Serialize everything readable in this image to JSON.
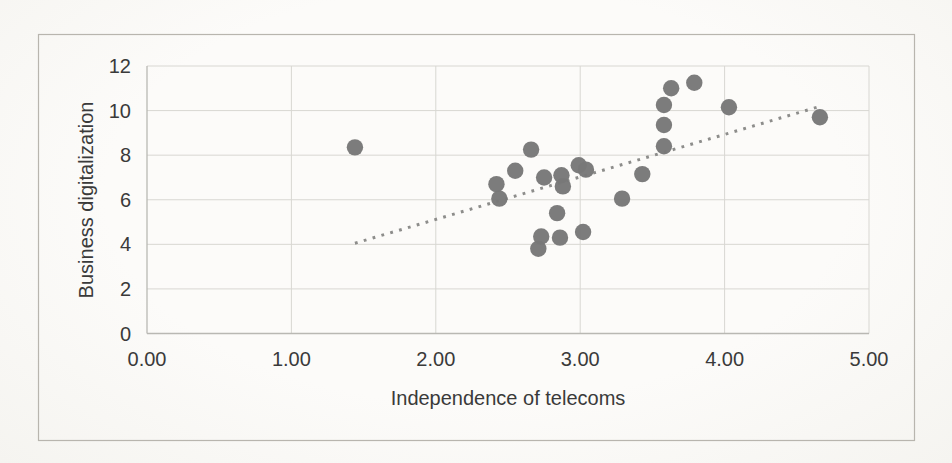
{
  "chart_data": {
    "type": "scatter",
    "title": "",
    "xlabel": "Independence of telecoms",
    "ylabel": "Business digitalization",
    "xlim": [
      0,
      5
    ],
    "ylim": [
      0,
      12
    ],
    "grid": true,
    "legend": false,
    "xticks": {
      "values": [
        0,
        1,
        2,
        3,
        4,
        5
      ],
      "labels": [
        "0.00",
        "1.00",
        "2.00",
        "3.00",
        "4.00",
        "5.00"
      ]
    },
    "yticks": {
      "values": [
        0,
        2,
        4,
        6,
        8,
        10,
        12
      ],
      "labels": [
        "0",
        "2",
        "4",
        "6",
        "8",
        "10",
        "12"
      ]
    },
    "points": [
      [
        1.44,
        8.35
      ],
      [
        2.42,
        6.7
      ],
      [
        2.44,
        6.05
      ],
      [
        2.55,
        7.3
      ],
      [
        2.66,
        8.25
      ],
      [
        2.71,
        3.8
      ],
      [
        2.73,
        4.35
      ],
      [
        2.75,
        7.0
      ],
      [
        2.84,
        5.4
      ],
      [
        2.86,
        4.3
      ],
      [
        2.87,
        7.1
      ],
      [
        2.88,
        6.6
      ],
      [
        2.99,
        7.55
      ],
      [
        3.04,
        7.35
      ],
      [
        3.02,
        4.55
      ],
      [
        3.29,
        6.05
      ],
      [
        3.43,
        7.15
      ],
      [
        3.58,
        8.4
      ],
      [
        3.58,
        9.35
      ],
      [
        3.58,
        10.25
      ],
      [
        3.63,
        11.0
      ],
      [
        3.79,
        11.25
      ],
      [
        4.03,
        10.15
      ],
      [
        4.66,
        9.7
      ]
    ],
    "trendline": {
      "type": "linear",
      "style": "dotted",
      "x1": 1.44,
      "y1": 4.05,
      "x2": 4.64,
      "y2": 10.15
    },
    "colors": {
      "point": "#787878",
      "trendline": "#8d8d8b",
      "grid": "#d8d7d2",
      "axis": "#b9b8b3",
      "frame_border": "#b8b5ae",
      "text": "#3a3a3a"
    }
  }
}
